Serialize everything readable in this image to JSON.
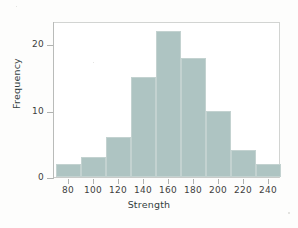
{
  "chart_data": {
    "type": "bar",
    "title": "",
    "xlabel": "Strength",
    "ylabel": "Frequency",
    "categories": [
      "70-90",
      "90-110",
      "110-130",
      "130-150",
      "150-170",
      "170-190",
      "190-210",
      "210-230",
      "230-250"
    ],
    "bin_edges": [
      70,
      90,
      110,
      130,
      150,
      170,
      190,
      210,
      230,
      250
    ],
    "values": [
      2,
      3,
      6,
      15,
      22,
      18,
      10,
      4,
      2
    ],
    "xlim": [
      68,
      250
    ],
    "ylim": [
      0,
      23.5
    ],
    "xticks": [
      80,
      100,
      120,
      140,
      160,
      180,
      200,
      220,
      240
    ],
    "xtick_labels": [
      "80",
      "100",
      "120",
      "140",
      "160",
      "180",
      "200",
      "220",
      "240"
    ],
    "yticks": [
      0,
      10,
      20
    ],
    "ytick_labels": [
      "0",
      "10",
      "20"
    ],
    "grid": false,
    "legend": null,
    "bar_color": "#aec4c2",
    "axis_color": "#b9bbb9",
    "text_color": "#3d3f3e"
  }
}
